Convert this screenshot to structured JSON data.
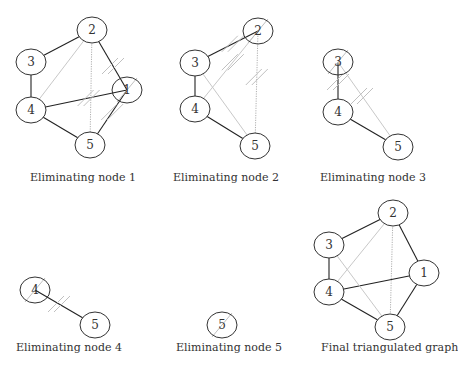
{
  "colors": {
    "edge": "#222222",
    "fill_edge": "#c8c8c8",
    "dotted_edge": "#b0b0b0",
    "hatch": "#c0c0c0",
    "node_stroke": "#333333"
  },
  "panels": [
    {
      "id": "p1",
      "caption": "Eliminating node 1",
      "caption_pos": [
        30,
        171
      ],
      "nodes": [
        {
          "id": "2",
          "x": 92,
          "y": 30
        },
        {
          "id": "3",
          "x": 31,
          "y": 62
        },
        {
          "id": "1",
          "x": 127,
          "y": 90
        },
        {
          "id": "4",
          "x": 31,
          "y": 110
        },
        {
          "id": "5",
          "x": 90,
          "y": 145
        }
      ],
      "edges": [
        {
          "a": "2",
          "b": "3",
          "style": "solid"
        },
        {
          "a": "3",
          "b": "4",
          "style": "solid"
        },
        {
          "a": "2",
          "b": "1",
          "style": "solid"
        },
        {
          "a": "4",
          "b": "1",
          "style": "solid"
        },
        {
          "a": "4",
          "b": "5",
          "style": "solid"
        },
        {
          "a": "1",
          "b": "5",
          "style": "solid"
        },
        {
          "a": "2",
          "b": "4",
          "style": "fill"
        },
        {
          "a": "2",
          "b": "5",
          "style": "dotted"
        }
      ],
      "hatched_node": "1"
    },
    {
      "id": "p2",
      "caption": "Eliminating node 2",
      "caption_pos": [
        173,
        171
      ],
      "nodes": [
        {
          "id": "2",
          "x": 258,
          "y": 31
        },
        {
          "id": "3",
          "x": 195,
          "y": 63
        },
        {
          "id": "4",
          "x": 195,
          "y": 109
        },
        {
          "id": "5",
          "x": 255,
          "y": 146
        }
      ],
      "edges": [
        {
          "a": "2",
          "b": "3",
          "style": "solid"
        },
        {
          "a": "3",
          "b": "4",
          "style": "solid"
        },
        {
          "a": "4",
          "b": "5",
          "style": "solid"
        },
        {
          "a": "2",
          "b": "4",
          "style": "fill"
        },
        {
          "a": "2",
          "b": "5",
          "style": "dotted"
        },
        {
          "a": "3",
          "b": "5",
          "style": "fill"
        }
      ],
      "hatched_node": "2"
    },
    {
      "id": "p3",
      "caption": "Eliminating node 3",
      "caption_pos": [
        320,
        171
      ],
      "nodes": [
        {
          "id": "3",
          "x": 338,
          "y": 62
        },
        {
          "id": "4",
          "x": 338,
          "y": 112
        },
        {
          "id": "5",
          "x": 398,
          "y": 147
        }
      ],
      "edges": [
        {
          "a": "3",
          "b": "4",
          "style": "solid"
        },
        {
          "a": "4",
          "b": "5",
          "style": "solid"
        },
        {
          "a": "3",
          "b": "5",
          "style": "fill"
        }
      ],
      "hatched_node": "3"
    },
    {
      "id": "p4",
      "caption": "Eliminating node 4",
      "caption_pos": [
        16,
        341
      ],
      "nodes": [
        {
          "id": "4",
          "x": 35,
          "y": 290
        },
        {
          "id": "5",
          "x": 95,
          "y": 325
        }
      ],
      "edges": [
        {
          "a": "4",
          "b": "5",
          "style": "solid"
        }
      ],
      "hatched_node": "4"
    },
    {
      "id": "p5",
      "caption": "Eliminating node 5",
      "caption_pos": [
        176,
        341
      ],
      "nodes": [
        {
          "id": "5",
          "x": 222,
          "y": 325
        }
      ],
      "edges": [],
      "hatched_node": "5"
    },
    {
      "id": "p6",
      "caption": "Final triangulated graph",
      "caption_pos": [
        321,
        341
      ],
      "nodes": [
        {
          "id": "2",
          "x": 393,
          "y": 213
        },
        {
          "id": "3",
          "x": 329,
          "y": 245
        },
        {
          "id": "1",
          "x": 424,
          "y": 273
        },
        {
          "id": "4",
          "x": 329,
          "y": 292
        },
        {
          "id": "5",
          "x": 390,
          "y": 327
        }
      ],
      "edges": [
        {
          "a": "2",
          "b": "3",
          "style": "solid"
        },
        {
          "a": "3",
          "b": "4",
          "style": "solid"
        },
        {
          "a": "2",
          "b": "1",
          "style": "solid"
        },
        {
          "a": "4",
          "b": "1",
          "style": "solid"
        },
        {
          "a": "4",
          "b": "5",
          "style": "solid"
        },
        {
          "a": "1",
          "b": "5",
          "style": "solid"
        },
        {
          "a": "2",
          "b": "4",
          "style": "fill"
        },
        {
          "a": "2",
          "b": "5",
          "style": "dotted"
        },
        {
          "a": "3",
          "b": "5",
          "style": "fill"
        }
      ],
      "hatched_node": null
    }
  ]
}
